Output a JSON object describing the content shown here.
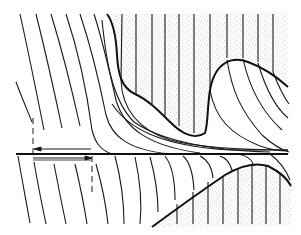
{
  "diagram": {
    "colors": {
      "background": "#ffffff",
      "line": "#1a1a1a",
      "stipple": "#9a9a9a"
    },
    "elements": {
      "axis_line": {
        "x1": 16,
        "y1": 154,
        "x2": 288,
        "y2": 154
      },
      "upper_stipple_region": {
        "top": 13,
        "left": 107,
        "right": 288
      },
      "lower_stipple_region": {
        "bottom": 226,
        "left": 152,
        "right": 290
      },
      "dashed_markers": [
        {
          "x": 33,
          "y1": 118,
          "y2": 153
        },
        {
          "x": 92,
          "y1": 156,
          "y2": 190
        }
      ],
      "arrows": [
        {
          "direction": "left",
          "y": 149,
          "x_from": 91,
          "x_to": 35
        },
        {
          "direction": "right",
          "y": 158,
          "x_from": 33,
          "x_to": 91
        }
      ]
    }
  }
}
